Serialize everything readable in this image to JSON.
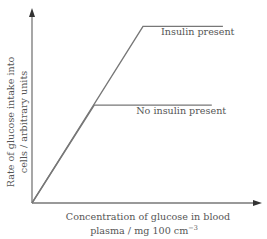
{
  "chart_data": {
    "type": "line",
    "title": "",
    "xlabel_lines": [
      "Concentration of glucose in blood",
      "plasma / mg 100 cm"
    ],
    "xlabel_superscript": "−3",
    "ylabel_lines": [
      "Rate of glucose intake into",
      "cells / arbitrary units"
    ],
    "xlim": [
      0,
      100
    ],
    "ylim": [
      0,
      100
    ],
    "grid": false,
    "ticks": "none",
    "series": [
      {
        "name": "Insulin present",
        "label": "Insulin present",
        "x": [
          0,
          50,
          86
        ],
        "y": [
          0,
          92,
          92
        ],
        "color": "#777777"
      },
      {
        "name": "No insulin present",
        "label": "No insulin present",
        "x": [
          0,
          28,
          81
        ],
        "y": [
          0,
          51,
          51
        ],
        "color": "#777777"
      }
    ],
    "annotations": [
      {
        "text": "Insulin present",
        "series": "Insulin present",
        "placement": "below-right of plateau"
      },
      {
        "text": "No insulin present",
        "series": "No insulin present",
        "placement": "below-right of plateau"
      }
    ],
    "axis_color": "#777777"
  }
}
